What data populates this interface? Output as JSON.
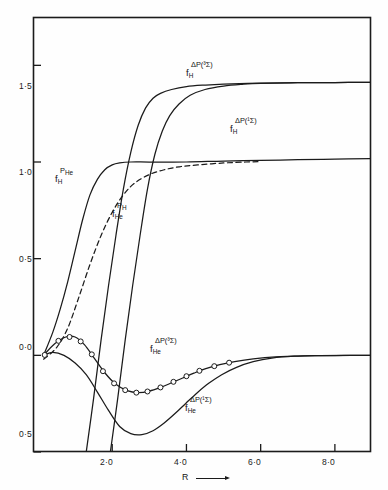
{
  "figure": {
    "background": "#fefefe",
    "ink": "#1b1b1b"
  },
  "axes": {
    "x_title": "R",
    "x_ticks": [
      "2·0",
      "4·0",
      "6·0",
      "8·0"
    ],
    "y_ticks": [
      "1·5",
      "1·0",
      "0·5",
      "0·0",
      "0·5"
    ]
  },
  "labels": {
    "fh_dp3": {
      "sup": "ΔP(³Σ)",
      "base": "f",
      "sub": "H"
    },
    "fh_dp1": {
      "sup": "ΔP(¹Σ)",
      "base": "f",
      "sub": "H"
    },
    "fh_phe": {
      "sup": "P",
      "sup_sub": "He",
      "base": "f",
      "sub": "H"
    },
    "fhe_ph": {
      "sup": "P",
      "sup_sub": "H",
      "base": "f",
      "sub": "He"
    },
    "fhe_dp3": {
      "sup": "ΔP(³Σ)",
      "base": "f",
      "sub": "He"
    },
    "fhe_dp1": {
      "sup": "ΔP(¹Σ)",
      "base": "f",
      "sub": "He"
    }
  },
  "chart_data": {
    "type": "line",
    "title": "",
    "xlabel": "R",
    "ylabel": "",
    "xlim": [
      0.0,
      9.0
    ],
    "ylim": [
      -0.5,
      1.75
    ],
    "xticks": [
      2.0,
      4.0,
      6.0,
      8.0
    ],
    "yticks": [
      -0.5,
      0.0,
      0.5,
      1.0,
      1.5
    ],
    "grid": false,
    "legend": "inline-annotations",
    "series": [
      {
        "name": "f_H^{P_He}",
        "style": "solid",
        "markers": false,
        "points": [
          [
            0.15,
            0.0
          ],
          [
            0.4,
            0.12
          ],
          [
            0.6,
            0.24
          ],
          [
            0.8,
            0.38
          ],
          [
            1.0,
            0.54
          ],
          [
            1.2,
            0.7
          ],
          [
            1.4,
            0.83
          ],
          [
            1.6,
            0.91
          ],
          [
            1.8,
            0.96
          ],
          [
            2.0,
            0.985
          ],
          [
            2.2,
            0.995
          ],
          [
            2.5,
            1.0
          ],
          [
            3.0,
            1.0
          ],
          [
            4.0,
            1.0
          ],
          [
            5.0,
            1.005
          ],
          [
            6.0,
            1.008
          ],
          [
            7.0,
            1.012
          ],
          [
            8.0,
            1.015
          ],
          [
            9.0,
            1.018
          ]
        ]
      },
      {
        "name": "f_He^{P_H}",
        "style": "dashed",
        "markers": false,
        "points": [
          [
            0.15,
            -0.02
          ],
          [
            0.5,
            0.04
          ],
          [
            0.8,
            0.14
          ],
          [
            1.1,
            0.3
          ],
          [
            1.4,
            0.47
          ],
          [
            1.7,
            0.62
          ],
          [
            2.0,
            0.74
          ],
          [
            2.3,
            0.83
          ],
          [
            2.6,
            0.89
          ],
          [
            3.0,
            0.935
          ],
          [
            3.4,
            0.96
          ],
          [
            3.8,
            0.975
          ],
          [
            4.3,
            0.985
          ],
          [
            5.0,
            0.995
          ],
          [
            5.6,
            1.0
          ],
          [
            6.0,
            1.002
          ]
        ]
      },
      {
        "name": "f_H^{ΔP(³Σ)}",
        "style": "solid",
        "markers": false,
        "points": [
          [
            1.3,
            -0.5
          ],
          [
            1.5,
            -0.22
          ],
          [
            1.7,
            0.08
          ],
          [
            1.9,
            0.36
          ],
          [
            2.1,
            0.62
          ],
          [
            2.3,
            0.86
          ],
          [
            2.5,
            1.05
          ],
          [
            2.7,
            1.19
          ],
          [
            2.9,
            1.28
          ],
          [
            3.1,
            1.33
          ],
          [
            3.3,
            1.355
          ],
          [
            3.6,
            1.375
          ],
          [
            4.0,
            1.39
          ],
          [
            4.5,
            1.398
          ],
          [
            5.0,
            1.403
          ],
          [
            6.0,
            1.408
          ],
          [
            7.0,
            1.41
          ],
          [
            8.0,
            1.411
          ],
          [
            9.0,
            1.412
          ]
        ]
      },
      {
        "name": "f_H^{ΔP(¹Σ)}",
        "style": "solid",
        "markers": false,
        "points": [
          [
            1.95,
            -0.5
          ],
          [
            2.15,
            -0.22
          ],
          [
            2.35,
            0.08
          ],
          [
            2.55,
            0.36
          ],
          [
            2.75,
            0.62
          ],
          [
            2.95,
            0.86
          ],
          [
            3.15,
            1.04
          ],
          [
            3.35,
            1.16
          ],
          [
            3.55,
            1.24
          ],
          [
            3.8,
            1.3
          ],
          [
            4.1,
            1.345
          ],
          [
            4.5,
            1.375
          ],
          [
            5.0,
            1.393
          ],
          [
            5.5,
            1.402
          ],
          [
            6.0,
            1.407
          ],
          [
            7.0,
            1.41
          ],
          [
            8.0,
            1.411
          ],
          [
            9.0,
            1.412
          ]
        ]
      },
      {
        "name": "f_He^{ΔP(³Σ)}",
        "style": "solid",
        "markers": "open-circle",
        "points": [
          [
            0.15,
            0.0
          ],
          [
            0.45,
            0.06
          ],
          [
            0.75,
            0.095
          ],
          [
            1.0,
            0.095
          ],
          [
            1.25,
            0.055
          ],
          [
            1.5,
            -0.01
          ],
          [
            1.8,
            -0.09
          ],
          [
            2.1,
            -0.15
          ],
          [
            2.4,
            -0.183
          ],
          [
            2.7,
            -0.193
          ],
          [
            3.0,
            -0.185
          ],
          [
            3.3,
            -0.166
          ],
          [
            3.6,
            -0.142
          ],
          [
            3.9,
            -0.117
          ],
          [
            4.2,
            -0.092
          ],
          [
            4.5,
            -0.07
          ],
          [
            4.9,
            -0.048
          ],
          [
            5.3,
            -0.032
          ],
          [
            5.8,
            -0.018
          ],
          [
            6.4,
            -0.008
          ],
          [
            7.2,
            -0.003
          ],
          [
            8.0,
            -0.001
          ],
          [
            9.0,
            0.0
          ]
        ],
        "marker_points": [
          [
            0.18,
            0.002
          ],
          [
            0.55,
            0.075
          ],
          [
            0.85,
            0.095
          ],
          [
            1.15,
            0.072
          ],
          [
            1.45,
            0.005
          ],
          [
            1.75,
            -0.082
          ],
          [
            2.05,
            -0.145
          ],
          [
            2.35,
            -0.18
          ],
          [
            2.65,
            -0.193
          ],
          [
            2.95,
            -0.187
          ],
          [
            3.3,
            -0.166
          ],
          [
            3.65,
            -0.137
          ],
          [
            4.0,
            -0.108
          ],
          [
            4.35,
            -0.08
          ],
          [
            4.75,
            -0.056
          ],
          [
            5.15,
            -0.038
          ]
        ]
      },
      {
        "name": "f_He^{ΔP(¹Σ)}",
        "style": "solid",
        "markers": false,
        "points": [
          [
            0.15,
            0.0
          ],
          [
            0.4,
            0.015
          ],
          [
            0.7,
            0.0
          ],
          [
            1.0,
            -0.04
          ],
          [
            1.3,
            -0.1
          ],
          [
            1.6,
            -0.19
          ],
          [
            1.9,
            -0.285
          ],
          [
            2.2,
            -0.368
          ],
          [
            2.5,
            -0.405
          ],
          [
            2.8,
            -0.41
          ],
          [
            3.1,
            -0.39
          ],
          [
            3.4,
            -0.35
          ],
          [
            3.7,
            -0.3
          ],
          [
            4.0,
            -0.245
          ],
          [
            4.3,
            -0.192
          ],
          [
            4.6,
            -0.145
          ],
          [
            4.95,
            -0.1
          ],
          [
            5.35,
            -0.062
          ],
          [
            5.8,
            -0.033
          ],
          [
            6.3,
            -0.014
          ],
          [
            6.9,
            -0.004
          ],
          [
            7.6,
            -0.001
          ],
          [
            9.0,
            0.0
          ]
        ]
      }
    ]
  }
}
